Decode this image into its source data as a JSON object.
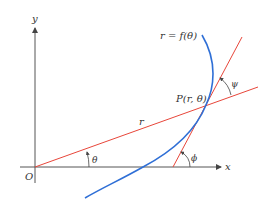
{
  "diagram": {
    "colors": {
      "axis": "#555555",
      "curve": "#2f6fd6",
      "lines": "#e8463a",
      "text": "#333333",
      "background": "#ffffff"
    },
    "labels": {
      "y_axis": "y",
      "x_axis": "x",
      "origin": "O",
      "curve": "r = f(θ)",
      "point": "P(r, θ)",
      "radius": "r",
      "theta": "θ",
      "phi": "ϕ",
      "psi": "ψ"
    },
    "elements": {
      "x_axis": "horizontal axis with arrow pointing right",
      "y_axis": "vertical axis with arrow pointing up",
      "curve": "blue polar curve r = f(θ)",
      "radial_line": "red line from origin O through point P",
      "tangent_line": "red tangent line to curve at P",
      "angle_theta": "angle between x-axis and radial line at O",
      "angle_phi": "angle between x-axis and tangent line",
      "angle_psi": "angle between radial line and tangent line at P"
    }
  }
}
